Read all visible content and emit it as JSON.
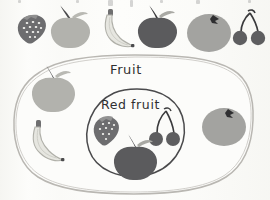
{
  "diagram": {
    "type": "set-diagram",
    "kind": "euler-venn-subset",
    "outer_set": {
      "label": "Fruit",
      "shape": "rounded-blob",
      "outline_color": "#b9b7b2",
      "fill_color": "#fcfcfa"
    },
    "inner_set": {
      "label": "Red fruit",
      "shape": "circle",
      "outline_color": "#4a4a4c",
      "fill_color": "#fbfbf9"
    },
    "members_outer_only": [
      "green-apple",
      "banana",
      "orange"
    ],
    "members_inner": [
      "strawberry",
      "cherries",
      "red-apple"
    ]
  },
  "legend_row": {
    "items": [
      {
        "name": "strawberry",
        "icon": "strawberry-icon",
        "color": "#6d6d6f",
        "label": "Strawberry"
      },
      {
        "name": "green-apple",
        "icon": "apple-icon",
        "color": "#b2b2ad",
        "label": "Green apple"
      },
      {
        "name": "banana",
        "icon": "banana-icon",
        "color": "#e3e3dd",
        "label": "Banana"
      },
      {
        "name": "red-apple",
        "icon": "apple-icon",
        "color": "#5b5b5d",
        "label": "Red apple"
      },
      {
        "name": "orange",
        "icon": "orange-icon",
        "color": "#a3a3a0",
        "label": "Orange"
      },
      {
        "name": "cherries",
        "icon": "cherries-icon",
        "color": "#5e5e60",
        "label": "Cherries"
      }
    ]
  },
  "palette": {
    "strawberry_body": "#6d6d6f",
    "strawberry_seed": "#f2f2ee",
    "green_apple_body": "#b2b2ad",
    "banana_body": "#e6e6e0",
    "banana_outline": "#b5b5ae",
    "red_apple_body": "#5b5b5d",
    "orange_body": "#a3a3a0",
    "cherry_body": "#5e5e60",
    "stem_dark": "#3a3a3c",
    "leaf_gray": "#b9b9b3",
    "ink": "#2f2f31",
    "outer_outline": "#b9b7b2",
    "inner_outline": "#4a4a4c",
    "page_bg": "#fdfdfb"
  },
  "labels": {
    "fruit": "Fruit",
    "red_fruit": "Red fruit"
  }
}
